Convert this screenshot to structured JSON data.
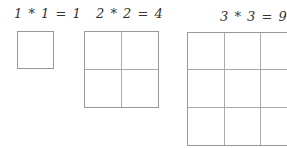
{
  "diagrams": [
    {
      "label": "1 * 1 = 1",
      "n": 1
    },
    {
      "label": "2 * 2 = 4",
      "n": 2
    },
    {
      "label": "3 * 3 = 9",
      "n": 3
    }
  ],
  "colors": {
    "grid_line": "#999999",
    "text": "#333333"
  }
}
